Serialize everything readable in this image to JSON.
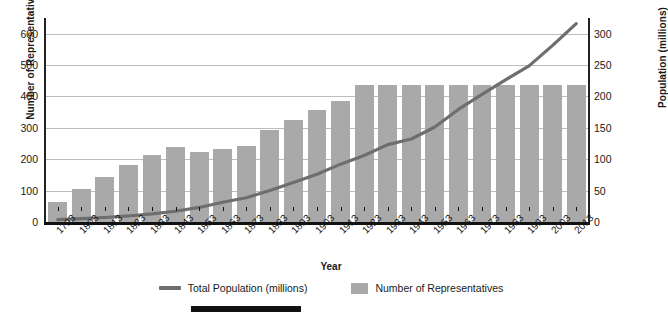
{
  "chart_data": {
    "type": "bar",
    "title": "",
    "xlabel": "Year",
    "ylabel": "Number of Representatives",
    "ylabel_secondary": "Population (millions)",
    "grid": true,
    "legend_position": "bottom",
    "ylim": [
      0,
      650
    ],
    "ylim_secondary": [
      0,
      325
    ],
    "yticks": [
      0,
      100,
      200,
      300,
      400,
      500,
      600
    ],
    "yticks_secondary": [
      0,
      50,
      100,
      150,
      200,
      250,
      300
    ],
    "categories": [
      "1793",
      "1803",
      "1813",
      "1823",
      "1833",
      "1843",
      "1853",
      "1863",
      "1873",
      "1883",
      "1893",
      "1903",
      "1913",
      "1923",
      "1933",
      "1943",
      "1953",
      "1963",
      "1973",
      "1983",
      "1993",
      "2003",
      "2013"
    ],
    "series": [
      {
        "name": "Number of Representatives",
        "type": "bar",
        "axis": "left",
        "color": "#a9a9a9",
        "values": [
          65,
          106,
          142,
          182,
          213,
          240,
          223,
          234,
          241,
          293,
          325,
          356,
          386,
          435,
          435,
          435,
          435,
          435,
          435,
          435,
          435,
          435,
          435
        ]
      },
      {
        "name": "Total Population (millions)",
        "type": "line",
        "axis": "right",
        "color": "#6e6e6e",
        "values": [
          3.9,
          5.3,
          7.2,
          9.6,
          12.9,
          17.1,
          23.2,
          31.4,
          38.6,
          50.2,
          62.9,
          76.2,
          92.2,
          106.0,
          123.2,
          132.2,
          151.3,
          179.3,
          203.2,
          226.5,
          248.7,
          281.4,
          316.1
        ]
      }
    ]
  },
  "axes": {
    "left_title": "Number of Representatives",
    "right_title": "Population (millions)",
    "x_title": "Year"
  },
  "legend": {
    "items": [
      {
        "label": "Total Population (millions)",
        "marker": "line",
        "color": "#6e6e6e"
      },
      {
        "label": "Number of Representatives",
        "marker": "box",
        "color": "#a9a9a9"
      }
    ]
  },
  "footer": {
    "caption": ""
  }
}
